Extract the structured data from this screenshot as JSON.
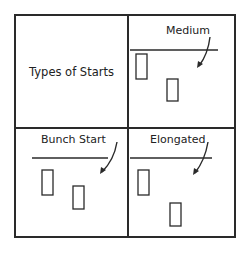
{
  "diagram": {
    "title": "Types of Starts",
    "panels": [
      {
        "id": "medium",
        "label": "Medium",
        "rect1": {
          "x": 8,
          "y": 38,
          "w": 11,
          "h": 25
        },
        "rect2": {
          "x": 39,
          "y": 63,
          "w": 11,
          "h": 22
        }
      },
      {
        "id": "bunch-start",
        "label": "Bunch Start",
        "rect1": {
          "x": 8,
          "y": 38,
          "w": 11,
          "h": 25
        },
        "rect2": {
          "x": 39,
          "y": 54,
          "w": 11,
          "h": 23
        }
      },
      {
        "id": "elongated",
        "label": "Elongated",
        "rect1": {
          "x": 8,
          "y": 38,
          "w": 11,
          "h": 25
        },
        "rect2": {
          "x": 39,
          "y": 70,
          "w": 11,
          "h": 23
        }
      }
    ],
    "line_color": "#2a2a2a"
  }
}
